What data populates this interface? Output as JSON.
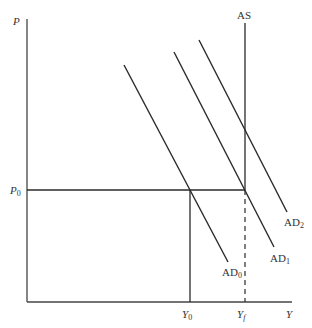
{
  "diagram": {
    "axes": {
      "y_label": "P",
      "x_label": "Y"
    },
    "price_level": {
      "label": "P",
      "sub": "0"
    },
    "outputs": [
      {
        "label": "Y",
        "sub": "0"
      },
      {
        "label": "Y",
        "sub": "f"
      }
    ],
    "curves": {
      "as": {
        "label": "AS"
      },
      "ad": [
        {
          "label": "AD",
          "sub": "0"
        },
        {
          "label": "AD",
          "sub": "1"
        },
        {
          "label": "AD",
          "sub": "2"
        }
      ]
    },
    "colors": {
      "line": "#2a2a2a",
      "text": "#333333"
    }
  }
}
